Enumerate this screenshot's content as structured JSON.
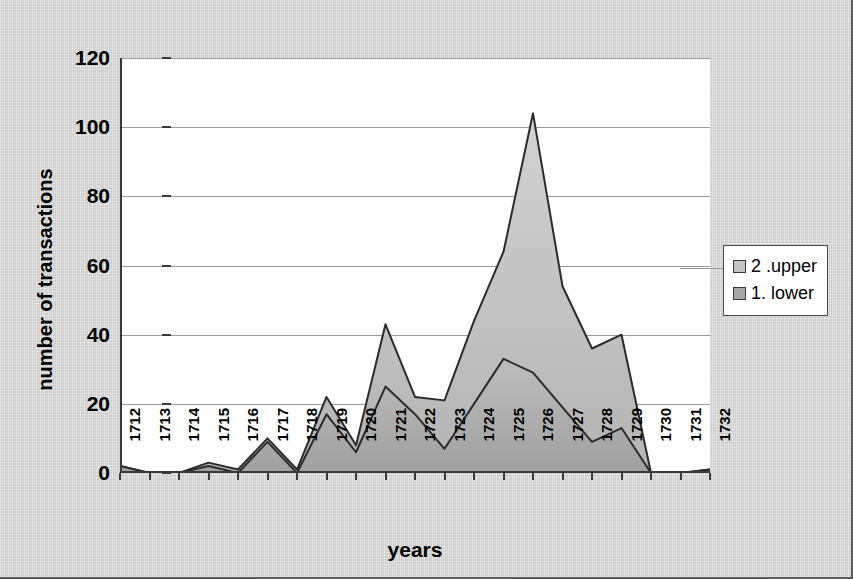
{
  "chart_data": {
    "type": "area",
    "stacked": true,
    "title": "",
    "xlabel": "years",
    "ylabel": "number of transactions",
    "categories": [
      "1712",
      "1713",
      "1714",
      "1715",
      "1716",
      "1717",
      "1718",
      "1719",
      "1720",
      "1721",
      "1722",
      "1723",
      "1724",
      "1725",
      "1726",
      "1727",
      "1728",
      "1729",
      "1730",
      "1731",
      "1732"
    ],
    "series": [
      {
        "name": "1. lower",
        "color": "#a8a8a8",
        "values": [
          2,
          0,
          0,
          2,
          0,
          9,
          0,
          17,
          6,
          25,
          17,
          7,
          20,
          33,
          29,
          19,
          9,
          13,
          0,
          0,
          1
        ]
      },
      {
        "name": "2 .upper",
        "color": "#c2c2c2",
        "values": [
          0,
          0,
          0,
          1,
          1,
          1,
          1,
          5,
          2,
          18,
          5,
          14,
          24,
          31,
          75,
          35,
          27,
          27,
          0,
          0,
          0
        ]
      }
    ],
    "totals": [
      2,
      0,
      0,
      3,
      1,
      10,
      1,
      22,
      8,
      43,
      22,
      21,
      44,
      64,
      104,
      54,
      36,
      40,
      0,
      0,
      1
    ],
    "ylim": [
      0,
      120
    ],
    "yticks": [
      0,
      20,
      40,
      60,
      80,
      100,
      120
    ],
    "grid": true,
    "legend_position": "right",
    "legend_entries": [
      "2 .upper",
      "1. lower"
    ]
  },
  "axes": {
    "y_title": "number of transactions",
    "x_title": "years",
    "y_tick_labels": [
      "120",
      "100",
      "80",
      "60",
      "40",
      "20",
      "0"
    ],
    "x_tick_labels": [
      "1712",
      "1713",
      "1714",
      "1715",
      "1716",
      "1717",
      "1718",
      "1719",
      "1720",
      "1721",
      "1722",
      "1723",
      "1724",
      "1725",
      "1726",
      "1727",
      "1728",
      "1729",
      "1730",
      "1731",
      "1732"
    ]
  },
  "legend": {
    "items": [
      {
        "label": "2 .upper",
        "color": "#c2c2c2"
      },
      {
        "label": "1. lower",
        "color": "#a8a8a8"
      }
    ]
  },
  "colors": {
    "background": "#d6d6d6",
    "plot_background": "#ffffff",
    "gridline": "#9a9a9a",
    "axis": "#3a3a3a",
    "upper_fill": "#c2c2c2",
    "lower_fill": "#a8a8a8",
    "series_outline": "#2b2b2b"
  }
}
